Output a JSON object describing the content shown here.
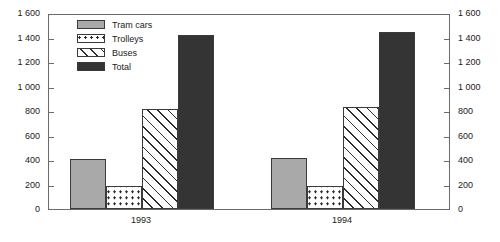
{
  "chart_data": {
    "type": "bar",
    "title": "",
    "xlabel": "",
    "ylabel": "",
    "ylim": [
      0,
      1600
    ],
    "grid": false,
    "legend_position": "top-left-inside",
    "dual_axis": true,
    "categories": [
      "1993",
      "1994"
    ],
    "series": [
      {
        "name": "Tram cars",
        "values": [
          410,
          415
        ],
        "pattern": "solid-gray",
        "color": "#a9a9a9"
      },
      {
        "name": "Trolleys",
        "values": [
          190,
          190
        ],
        "pattern": "dotted",
        "color": "#ffffff"
      },
      {
        "name": "Buses",
        "values": [
          815,
          835
        ],
        "pattern": "diagonal-hatch",
        "color": "#ffffff"
      },
      {
        "name": "Total",
        "values": [
          1420,
          1445
        ],
        "pattern": "solid-dark",
        "color": "#343434"
      }
    ],
    "yticks": [
      0,
      200,
      400,
      600,
      800,
      1000,
      1200,
      1400,
      1600
    ],
    "ytick_labels_left": [
      "0",
      "200",
      "400",
      "600",
      "800",
      "1 000",
      "1 200",
      "1 400",
      "1 600"
    ],
    "ytick_labels_right": [
      "0",
      "200",
      "400",
      "600",
      "800",
      "1 000",
      "1 200",
      "1 400",
      "1 600"
    ]
  },
  "legend": {
    "items": [
      {
        "label": "Tram cars",
        "swatch": "swatch-tram"
      },
      {
        "label": "Trolleys",
        "swatch": "swatch-trolley"
      },
      {
        "label": "Buses",
        "swatch": "swatch-bus"
      },
      {
        "label": "Total",
        "swatch": "swatch-total"
      }
    ]
  },
  "colors": {
    "tram_cars": "#a9a9a9",
    "trolleys": "#ffffff",
    "buses": "#ffffff",
    "total": "#343434",
    "axis": "#6b6b6b",
    "bar_outline": "#3a3a3a",
    "text": "#1a1a1a",
    "background": "#ffffff"
  }
}
